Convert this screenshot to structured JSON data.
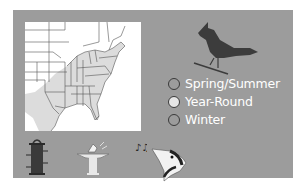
{
  "range_map": {
    "region": "Eastern United States",
    "legend": {
      "items": [
        {
          "label": "Spring/Summer",
          "color": "#9c9c9c"
        },
        {
          "label": "Year-Round",
          "color": "#e6e6e6"
        },
        {
          "label": "Winter",
          "color": "#9c9c9c"
        }
      ]
    },
    "colors": {
      "panel": "#9c9c9c",
      "map_background": "#ffffff",
      "range_fill": "#dcdcdc",
      "state_lines": "#555555",
      "bird": "#3c3c3c"
    }
  },
  "icons": {
    "bird": "cardinal-silhouette-icon",
    "feeder": "tube-feeder-icon",
    "bath": "birdbath-icon",
    "song": "music-notes-icon",
    "head": "woodpecker-head-icon"
  }
}
